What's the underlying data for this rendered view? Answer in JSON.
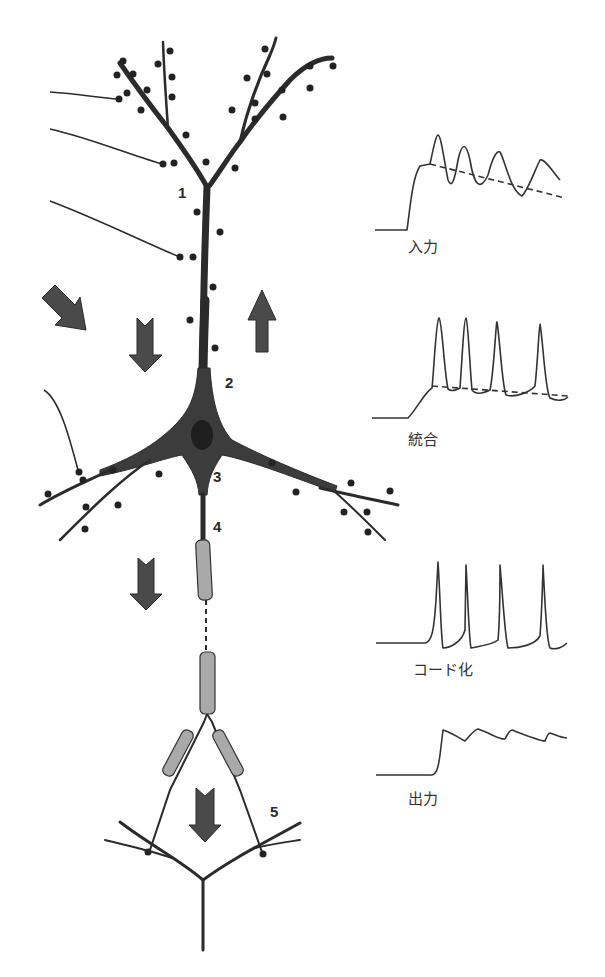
{
  "figure": {
    "region_labels": [
      "1",
      "2",
      "3",
      "4",
      "5"
    ],
    "signal_traces": [
      {
        "id": "input",
        "label": "入力"
      },
      {
        "id": "integration",
        "label": "統合"
      },
      {
        "id": "encoding",
        "label": "コード化"
      },
      {
        "id": "output",
        "label": "出力"
      }
    ],
    "colors": {
      "ink": "#2b2b2b",
      "arrow_fill": "#4a4a4a",
      "myelin_fill": "#a9a9a9",
      "background": "#ffffff"
    }
  }
}
